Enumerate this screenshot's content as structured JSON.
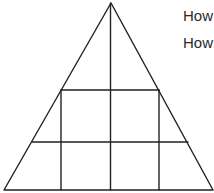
{
  "puzzle": {
    "questions": [
      "How",
      "How"
    ],
    "stroke_color": "#222222",
    "text_color": "#2a2a2a",
    "background": "#ffffff"
  },
  "figure": {
    "triangle": {
      "apex": [
        111,
        3
      ],
      "left": [
        4,
        190
      ],
      "right": [
        213,
        190
      ]
    },
    "horizontals": [
      {
        "y": 90,
        "x1": 61,
        "x2": 159
      },
      {
        "y": 142,
        "x1": 32,
        "x2": 188
      }
    ],
    "verticals": [
      {
        "x": 61,
        "y1": 90,
        "y2": 190
      },
      {
        "x": 110.5,
        "y1": 3,
        "y2": 190
      },
      {
        "x": 159,
        "y1": 90,
        "y2": 190
      }
    ]
  }
}
